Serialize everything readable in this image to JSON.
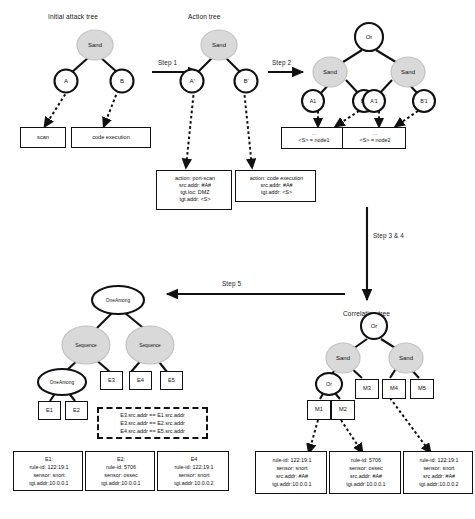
{
  "figure": {
    "type": "process-diagram"
  },
  "titles": {
    "initial_attack_tree": "Initial attack tree",
    "action_tree": "Action tree",
    "correlation_tree": "Correlation tree"
  },
  "steps": {
    "step1": "Step 1",
    "step2": "Step 2",
    "step34": "Step 3 & 4",
    "step5": "Step 5"
  },
  "trees": {
    "initial_attack_tree": {
      "root": "Sand",
      "leaves": [
        "A",
        "B"
      ],
      "leaf_boxes": [
        "scan",
        "code execution"
      ]
    },
    "action_tree": {
      "root": "Sand",
      "leaves": [
        "A'",
        "B'"
      ],
      "detail_boxes": [
        {
          "lines": [
            "action: port-scan",
            "src.addr: #A#",
            "tgt.loc: DMZ",
            "tgt.addr: <S>"
          ]
        },
        {
          "lines": [
            "action: code execution",
            "src.addr: #A#",
            "tgt.addr: <S>"
          ]
        }
      ]
    },
    "instantiated_tree": {
      "root": "Or",
      "mid": [
        "Sand",
        "Sand"
      ],
      "leaves": [
        "A1",
        "B1",
        "A'1",
        "B'1"
      ],
      "detail_boxes": [
        {
          "lines": [
            "...",
            "<S> = node1"
          ]
        },
        {
          "lines": [
            "...",
            "<S> = node2"
          ]
        }
      ]
    },
    "correlation_tree": {
      "root": "Or",
      "level2": [
        "Sand",
        "Sand"
      ],
      "level3": [
        "Or",
        "M3",
        "M4",
        "M5"
      ],
      "level4": [
        "M1",
        "M2"
      ],
      "detail_boxes": [
        {
          "lines": [
            "rule-id: 122:19:1",
            "sensor: snort",
            "src.addr: #A#",
            "tgt.addr:10.0.0.1"
          ]
        },
        {
          "lines": [
            "rule-id: 5706",
            "sensor: ossec",
            "src.addr: #A#",
            "tgt.addr:10.0.0.1"
          ]
        },
        {
          "lines": [
            "rule-id: 122:19:1",
            "sensor: snort",
            "src.addr: #A#",
            "tgt.addr:10.0.0.2"
          ]
        }
      ]
    },
    "detection_tree": {
      "root": "OneAmong",
      "level2": [
        "Sequence",
        "Sequence"
      ],
      "level3": [
        "OneAmong",
        "E3",
        "E4",
        "E5"
      ],
      "level4": [
        "E1",
        "E2"
      ],
      "constraints": [
        "E3.src.addr == E1.src.addr",
        "E3.src.addr == E2.src.addr",
        "E4.src.addr == E5.src.addr"
      ],
      "detail_boxes": [
        {
          "lines": [
            "E1:",
            "rule-id: 122:19:1",
            "sensor: snort",
            "tgt.addr:10.0.0.1"
          ]
        },
        {
          "lines": [
            "E2:",
            "rule-id: 5706",
            "sensor: ossec",
            "tgt.addr:10.0.0.1"
          ]
        },
        {
          "lines": [
            "E4",
            "rule-id: 122:19:1",
            "sensor: snort",
            "tgt.addr:10.0.0.2"
          ]
        }
      ]
    }
  },
  "colors": {
    "node_fill_white": "#ffffff",
    "node_fill_grey": "#d9d9d9",
    "stroke": "#111111",
    "background": "#ffffff"
  }
}
